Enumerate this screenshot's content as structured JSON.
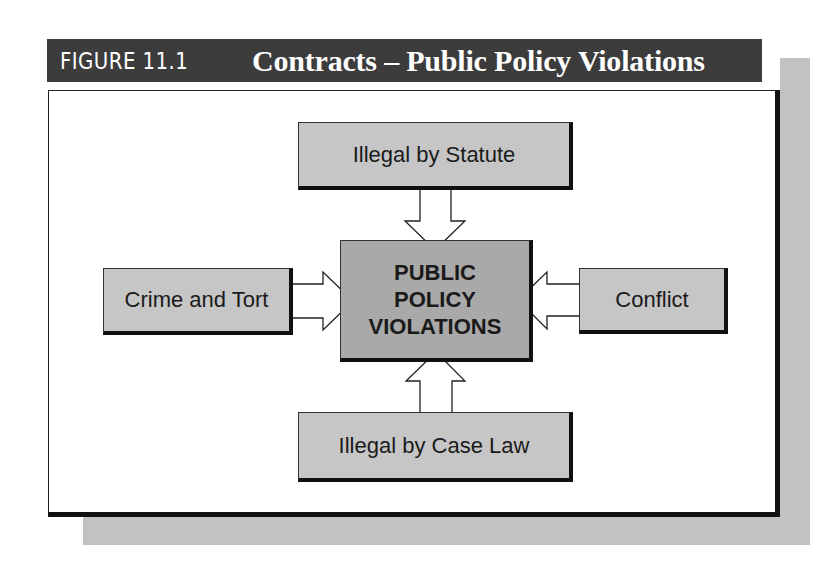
{
  "figure": {
    "label": "FIGURE 11.1",
    "title": "Contracts – Public Policy Violations"
  },
  "diagram": {
    "center": {
      "lines": [
        "PUBLIC",
        "POLICY",
        "VIOLATIONS"
      ]
    },
    "nodes": {
      "top": "Illegal by Statute",
      "left": "Crime and Tort",
      "right": "Conflict",
      "bottom": "Illegal by Case Law"
    },
    "edges": [
      {
        "from": "Illegal by Statute",
        "to": "PUBLIC POLICY VIOLATIONS",
        "direction": "down"
      },
      {
        "from": "Crime and Tort",
        "to": "PUBLIC POLICY VIOLATIONS",
        "direction": "right"
      },
      {
        "from": "Conflict",
        "to": "PUBLIC POLICY VIOLATIONS",
        "direction": "left"
      },
      {
        "from": "Illegal by Case Law",
        "to": "PUBLIC POLICY VIOLATIONS",
        "direction": "up"
      }
    ]
  },
  "colors": {
    "header_bg": "#3c3c3c",
    "header_text": "#ffffff",
    "node_fill": "#c6c6c6",
    "center_fill": "#a9a9a9",
    "shadow": "#c2c2c2",
    "border": "#111111"
  }
}
